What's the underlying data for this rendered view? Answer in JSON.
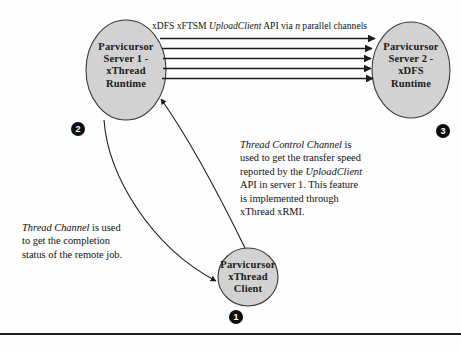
{
  "figure": {
    "background_color": "#fefefe",
    "node_fill_color": "#d2d2d2",
    "node_stroke_color": "#3a3a3a",
    "badge_color": "#0d0d0d",
    "line_color": "#1c1c1c"
  },
  "nodes": [
    {
      "id": "server1",
      "label": "Parvicursor\nServer 1 -\nxThread\nRuntime",
      "badge": "2"
    },
    {
      "id": "server2",
      "label": "Parvicursor\nServer 2 -\nxDFS\nRuntime",
      "badge": "3"
    },
    {
      "id": "client",
      "label": "Parvicursor\nxThread\nClient",
      "badge": "1"
    }
  ],
  "edges": {
    "parallel_channels": {
      "label_plain": "xDFS xFTSM UploadClient API via n parallel channels",
      "label_part_1": "xDFS xFTSM ",
      "label_italic_1": "UploadClient",
      "label_part_2": " API via ",
      "label_italic_2": "n",
      "label_part_3": " parallel channels",
      "channel_count": "5"
    }
  },
  "notes": {
    "thread_control_channel": {
      "plain_text": "Thread Control Channel is used to get the transfer speed reported by the UploadClient API in server 1. This feature is implemented through xThread xRMI.",
      "italic_1": "Thread Control Channel",
      "part_1": " is",
      "line_2": "used to get the transfer speed",
      "line_3_part_1": "reported by the ",
      "italic_2": "UploadClient",
      "line_4": "API in server 1. This feature",
      "line_5": "is implemented through",
      "line_6": "xThread xRMI."
    },
    "thread_channel": {
      "plain_text": "Thread Channel is used to get the completion status of the remote job.",
      "italic_1": "Thread Channel",
      "part_1": " is used",
      "line_2": "to get the completion",
      "line_3": "status of the remote job."
    }
  }
}
